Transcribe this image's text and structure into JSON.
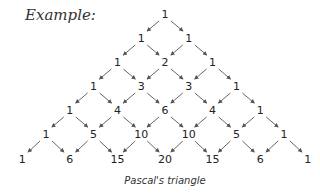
{
  "title": "Example:",
  "caption": "Pascal's triangle",
  "rows": [
    [
      1
    ],
    [
      1,
      1
    ],
    [
      1,
      2,
      1
    ],
    [
      1,
      3,
      3,
      1
    ],
    [
      1,
      4,
      6,
      4,
      1
    ],
    [
      1,
      5,
      10,
      10,
      5,
      1
    ],
    [
      1,
      6,
      15,
      20,
      15,
      6,
      1
    ]
  ],
  "colors": {
    "text": "#222222",
    "arrow": "#555555"
  }
}
